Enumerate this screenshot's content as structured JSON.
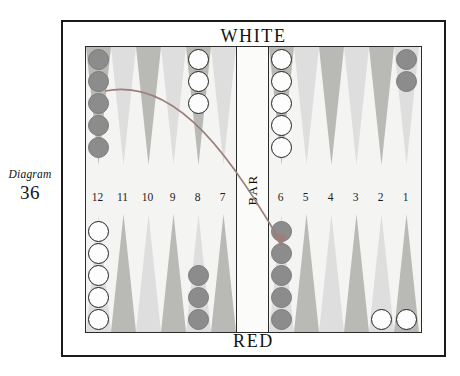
{
  "caption": {
    "word": "Diagram",
    "number": "36"
  },
  "banners": {
    "top": "WHITE",
    "bottom": "RED"
  },
  "bar": {
    "label": "BAR"
  },
  "numbers": {
    "left": [
      "12",
      "11",
      "10",
      "9",
      "8",
      "7"
    ],
    "right": [
      "6",
      "5",
      "4",
      "3",
      "2",
      "1"
    ]
  },
  "colors": {
    "dark_checker": "#8c8c8c",
    "white_checker": "#fdfdfd",
    "point_dark": "#b9b9b5",
    "point_light": "#dedede",
    "board_surface": "#f4f4f2",
    "frame": "#1a1a1a"
  },
  "board": {
    "points": [
      {
        "id": "p12",
        "quadrant": "top-left",
        "slot": 0,
        "shade": "dark",
        "checkers": 5,
        "color": "dark"
      },
      {
        "id": "p11",
        "quadrant": "top-left",
        "slot": 1,
        "shade": "light",
        "checkers": 0,
        "color": "none"
      },
      {
        "id": "p10",
        "quadrant": "top-left",
        "slot": 2,
        "shade": "dark",
        "checkers": 0,
        "color": "none"
      },
      {
        "id": "p9",
        "quadrant": "top-left",
        "slot": 3,
        "shade": "light",
        "checkers": 0,
        "color": "none"
      },
      {
        "id": "p8",
        "quadrant": "top-left",
        "slot": 4,
        "shade": "dark",
        "checkers": 3,
        "color": "white"
      },
      {
        "id": "p7",
        "quadrant": "top-left",
        "slot": 5,
        "shade": "light",
        "checkers": 0,
        "color": "none"
      },
      {
        "id": "p6",
        "quadrant": "top-right",
        "slot": 0,
        "shade": "dark",
        "checkers": 5,
        "color": "white"
      },
      {
        "id": "p5",
        "quadrant": "top-right",
        "slot": 1,
        "shade": "light",
        "checkers": 0,
        "color": "none"
      },
      {
        "id": "p4",
        "quadrant": "top-right",
        "slot": 2,
        "shade": "dark",
        "checkers": 0,
        "color": "none"
      },
      {
        "id": "p3",
        "quadrant": "top-right",
        "slot": 3,
        "shade": "light",
        "checkers": 0,
        "color": "none"
      },
      {
        "id": "p2",
        "quadrant": "top-right",
        "slot": 4,
        "shade": "dark",
        "checkers": 0,
        "color": "none"
      },
      {
        "id": "p1",
        "quadrant": "top-right",
        "slot": 5,
        "shade": "light",
        "checkers": 2,
        "color": "dark"
      },
      {
        "id": "p13",
        "quadrant": "bot-left",
        "slot": 0,
        "shade": "light",
        "checkers": 5,
        "color": "white"
      },
      {
        "id": "p14",
        "quadrant": "bot-left",
        "slot": 1,
        "shade": "dark",
        "checkers": 0,
        "color": "none"
      },
      {
        "id": "p15",
        "quadrant": "bot-left",
        "slot": 2,
        "shade": "light",
        "checkers": 0,
        "color": "none"
      },
      {
        "id": "p16",
        "quadrant": "bot-left",
        "slot": 3,
        "shade": "dark",
        "checkers": 0,
        "color": "none"
      },
      {
        "id": "p17",
        "quadrant": "bot-left",
        "slot": 4,
        "shade": "light",
        "checkers": 3,
        "color": "dark"
      },
      {
        "id": "p18",
        "quadrant": "bot-left",
        "slot": 5,
        "shade": "dark",
        "checkers": 0,
        "color": "none"
      },
      {
        "id": "p19",
        "quadrant": "bot-right",
        "slot": 0,
        "shade": "light",
        "checkers": 5,
        "color": "dark"
      },
      {
        "id": "p20",
        "quadrant": "bot-right",
        "slot": 1,
        "shade": "dark",
        "checkers": 0,
        "color": "none"
      },
      {
        "id": "p21",
        "quadrant": "bot-right",
        "slot": 2,
        "shade": "light",
        "checkers": 0,
        "color": "none"
      },
      {
        "id": "p22",
        "quadrant": "bot-right",
        "slot": 3,
        "shade": "dark",
        "checkers": 0,
        "color": "none"
      },
      {
        "id": "p23",
        "quadrant": "bot-right",
        "slot": 4,
        "shade": "light",
        "checkers": 1,
        "color": "white"
      },
      {
        "id": "p24",
        "quadrant": "bot-right",
        "slot": 5,
        "shade": "dark",
        "checkers": 1,
        "color": "white"
      }
    ],
    "move_arrow": {
      "from": "p19",
      "to": "p24"
    }
  }
}
